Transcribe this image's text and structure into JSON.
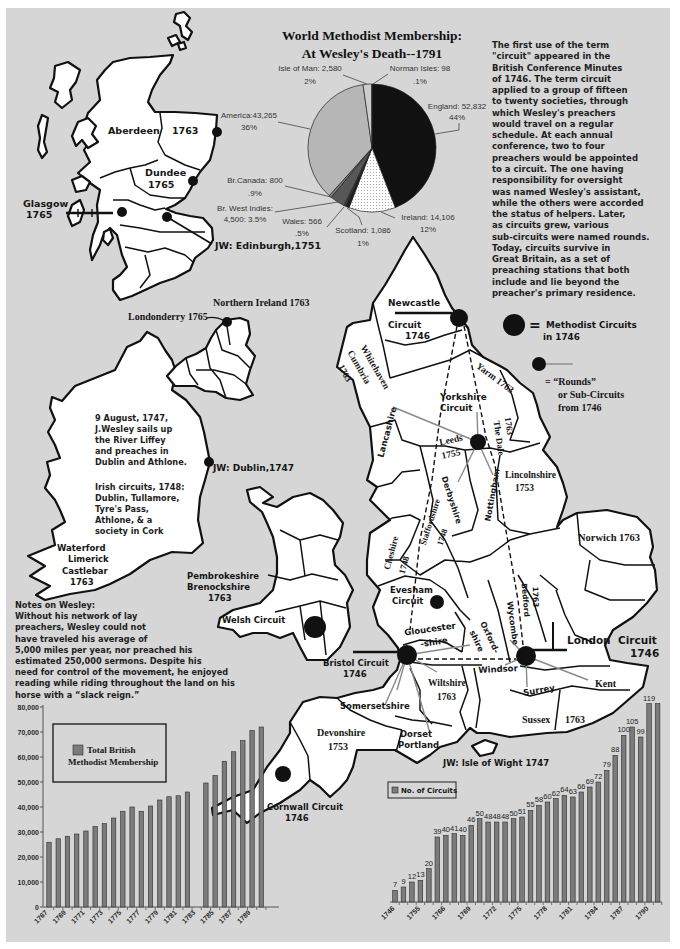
{
  "pie_title": {
    "line1": "World Methodist Membership:",
    "line2": "At Wesley's Death--1791"
  },
  "intro": {
    "lines": [
      "The first use of the term",
      "\"circuit\" appeared in the",
      "British Conference Minutes",
      "of 1746. The term circuit",
      "applied to a group of fifteen",
      "to twenty societies, through",
      "which Wesley's preachers",
      "would travel on a regular",
      "schedule. At each annual",
      "conference, two to four",
      "preachers would be appointed",
      "to a circuit. The one having",
      "responsibility for oversight",
      "was named Wesley's assistant,",
      "while the others were accorded",
      "the status of helpers. Later,",
      "as circuits grew, various",
      "sub-circuits were named rounds.",
      "Today, circuits survive in",
      "Great Britain, as a set of",
      "preaching stations that both",
      "include and lie beyond the",
      "preacher's primary residence."
    ]
  },
  "legend": {
    "circuits_equals": "=",
    "circuits_label": "Methodist Circuits",
    "circuits_label2": "in 1746",
    "rounds_label": "= “Rounds”",
    "rounds_label2": "or Sub-Circuits",
    "rounds_label3": "from 1746"
  },
  "scotland": {
    "aberdeen": "Aberdeen",
    "aberdeen_year": "1763",
    "dundee": "Dundee",
    "dundee_year": "1765",
    "glasgow": "Glasgow",
    "glasgow_year": "1765",
    "edinburgh": "JW: Edinburgh,1751"
  },
  "ireland": {
    "northern_ireland": "Northern Ireland 1763",
    "londonderry": "Londonderry 1765",
    "narrative_lines": [
      "9 August, 1747,",
      "J.Wesley sails up",
      "the River Liffey",
      "and preaches in",
      "Dublin and Athlone."
    ],
    "circuits_lines": [
      "Irish circuits, 1748:",
      "Dublin, Tullamore,",
      "Tyre's Pass,",
      "Athlone, & a",
      "society in Cork"
    ],
    "dublin": "JW: Dublin,1747",
    "south_lines": [
      "Waterford",
      "Limerick",
      "Castlebar",
      "1763"
    ]
  },
  "wales": {
    "lines": [
      "Pembrokeshire",
      "Brenockshire",
      "1763"
    ],
    "welsh_circuit": "Welsh Circuit"
  },
  "england": {
    "newcastle": "Newcastle",
    "newcastle_circuit": "Circuit",
    "newcastle_year": "1746",
    "whitehaven": "Whitehaven",
    "cumbria": "Cumbria",
    "cumbria_year": "1763",
    "yarm": "Yarm 1763",
    "yorkshire": "Yorkshire",
    "yorkshire_circuit": "Circuit",
    "lancashire": "Lancashire",
    "leeds": "Leeds",
    "leeds_year": "1755",
    "dales_year": "1763",
    "dales": "The Dale",
    "lincolnshire": "Lincolnshire",
    "lincolnshire_year": "1753",
    "derbyshire": "Derbyshire",
    "nottingham": "Nottingham",
    "staffordshire": "Staffordshire",
    "staffordshire_year": "1748",
    "cheshire": "Cheshire",
    "cheshire_year": "1748",
    "norwich": "Norwich 1763",
    "evesham": "Evesham",
    "evesham_circuit": "Circuit",
    "bedford": "Bedford",
    "bedford_year": "1763",
    "wycombe": "Wycombe",
    "gloucester": "Gloucester",
    "gloucester2": "-shire",
    "oxford": "Oxford-",
    "oxford2": "shire",
    "london": "London",
    "london_circuit": "Circuit",
    "london_year": "1746",
    "windsor": "Windsor",
    "kent": "Kent",
    "surrey": "Surrey",
    "sussex": "Sussex",
    "sussex_year": "1763",
    "wiltshire": "Wiltshire",
    "wiltshire_year": "1763",
    "somerset": "Somersetshire",
    "dorset": "Dorset",
    "portland": "Portland",
    "bristol": "Bristol Circuit",
    "bristol_year": "1746",
    "devon": "Devonshire",
    "devon_year": "1753",
    "cornwall": "Cornwall Circuit",
    "cornwall_year": "1746",
    "isle_of_wight": "JW: Isle of Wight 1747"
  },
  "notes": {
    "lines": [
      "Notes on Wesley:",
      "Without his network of lay",
      "preachers, Wesley could not",
      "have traveled his average of",
      "5,000 miles per year, nor preached his",
      "estimated 250,000 sermons. Despite his",
      "need for control of the movement, he enjoyed",
      "reading while riding throughout the land on his",
      "horse with a “slack reign.”"
    ]
  },
  "chart_data": [
    {
      "type": "pie",
      "title": "World Methodist Membership: At Wesley's Death--1791",
      "slices": [
        {
          "label": "England",
          "value": 52832,
          "value_text": "England: 52,832",
          "percent_text": "44%",
          "fill": "#111111"
        },
        {
          "label": "Ireland",
          "value": 14106,
          "value_text": "Ireland: 14,106",
          "percent_text": "12%",
          "fill": "pattern-dots"
        },
        {
          "label": "Scotland",
          "value": 1086,
          "value_text": "Scotland: 1,086",
          "percent_text": "1%",
          "fill": "#1e1e1e"
        },
        {
          "label": "Wales",
          "value": 566,
          "value_text": "Wales: 566",
          "percent_text": ".5%",
          "fill": "#3c3c3c"
        },
        {
          "label": "Br. West Indies",
          "value": 4500,
          "value_text": "Br. West Indies:",
          "percent_text": "4,500: 3.5%",
          "fill": "#575757"
        },
        {
          "label": "Br.Canada",
          "value": 800,
          "value_text": "Br.Canada: 800",
          "percent_text": ".9%",
          "fill": "#7d7d7d"
        },
        {
          "label": "America",
          "value": 43265,
          "value_text": "America:43,265",
          "percent_text": "36%",
          "fill": "#b6b6b6"
        },
        {
          "label": "Isle of Man",
          "value": 2580,
          "value_text": "Isle of Man: 2,580",
          "percent_text": "2%",
          "fill": "#cdcdcd"
        },
        {
          "label": "Norman Isles",
          "value": 98,
          "value_text": "Norman Isles: 98",
          "percent_text": ".1%",
          "fill": "#f2f2f2"
        }
      ]
    },
    {
      "type": "bar",
      "title": "",
      "legend": [
        "Total British",
        "Methodist Membership"
      ],
      "xlabel": "",
      "ylabel": "",
      "categories": [
        "1767",
        "1768",
        "1769",
        "1770",
        "1771",
        "1772",
        "1773",
        "1774",
        "1775",
        "1776",
        "1777",
        "1778",
        "1779",
        "1780",
        "1781",
        "1782",
        "1783",
        "1784",
        "1785",
        "1786",
        "1787",
        "1788",
        "1789",
        "1790"
      ],
      "values": [
        25900,
        27300,
        28300,
        29200,
        30400,
        32200,
        33400,
        35600,
        38300,
        40000,
        38300,
        40400,
        42800,
        44100,
        44500,
        46000,
        null,
        49600,
        52600,
        58300,
        62100,
        66600,
        70600,
        72000
      ],
      "xtick_labels": [
        "1767",
        "1769",
        "1771",
        "1773",
        "1775",
        "1777",
        "1779",
        "1781",
        "1783",
        "1785",
        "1787",
        "1789"
      ],
      "ylim": [
        0,
        80000
      ],
      "ytick_values": [
        0,
        10000,
        20000,
        30000,
        40000,
        50000,
        60000,
        70000,
        80000
      ],
      "ytick_labels": [
        "0",
        "10,000",
        "20,000",
        "30,000",
        "40,000",
        "50,000",
        "60,000",
        "70,000",
        "80,000"
      ],
      "grid": false,
      "legend_position": "top-left"
    },
    {
      "type": "bar",
      "title": "",
      "legend": "No. of Circuits",
      "xlabel": "",
      "ylabel": "",
      "categories": [
        "1746",
        "",
        "",
        "1755",
        "",
        "",
        "1766",
        "",
        "",
        "1769",
        "",
        "",
        "1772",
        "",
        "",
        "1775",
        "",
        "",
        "1778",
        "",
        "",
        "1781",
        "",
        "",
        "1784",
        "",
        "",
        "1787",
        "",
        "",
        "1790",
        ""
      ],
      "values": [
        7,
        9,
        12,
        13,
        20,
        39,
        40,
        41,
        40,
        46,
        50,
        48,
        48,
        48,
        50,
        51,
        55,
        58,
        60,
        62,
        64,
        63,
        66,
        69,
        72,
        79,
        88,
        100,
        105,
        99,
        119,
        119
      ],
      "data_labels": [
        "7",
        "9",
        "12",
        "13",
        "20",
        "39",
        "40",
        "41",
        "40",
        "46",
        "50",
        "48",
        "48",
        "48",
        "50",
        "51",
        "55",
        "58",
        "60",
        "62",
        "64",
        "63",
        "66",
        "69",
        "72",
        "79",
        "88",
        "100",
        "105",
        "99",
        "119",
        ""
      ],
      "ylim": [
        0,
        120
      ],
      "grid": false,
      "legend_position": "top-left"
    }
  ]
}
